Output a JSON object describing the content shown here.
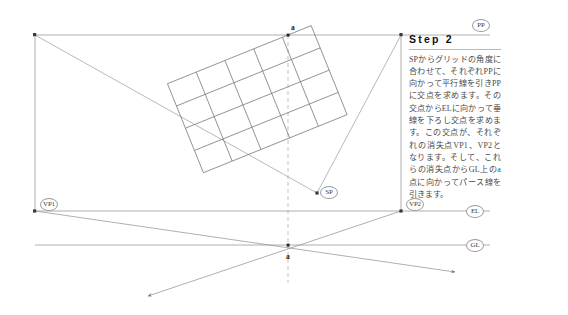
{
  "figure": {
    "title": "Step 2",
    "description_ja": "SPからグリッドの角度に合わせて、それぞれPPに向かって平行線を引きPPに交点を求めます。その交点からELに向かって垂線を下ろし交点を求めます。この交点が、それぞれの消失点VP1、VP2となります。そして、これらの消失点からGL上のa点に向かってパース線を引きます。"
  },
  "labels": {
    "pp": "PP",
    "el": "EL",
    "gl": "GL",
    "vp1": "VP1",
    "vp2": "VP2",
    "sp": "SP",
    "point_a_top": "a",
    "point_a_bottom": "a"
  },
  "geometry": {
    "lines": {
      "pp_y": 35,
      "el_y": 211,
      "gl_y": 245,
      "left_x": 35,
      "right_x": 490
    },
    "points": {
      "vp1": [
        35,
        211
      ],
      "vp2": [
        401,
        211
      ],
      "sp": [
        317,
        193
      ],
      "a_top": [
        288,
        35
      ],
      "a_bottom": [
        288,
        262
      ]
    },
    "grid": {
      "cols": 5,
      "rows": 4,
      "rotation_deg": -22,
      "origin": [
        288,
        35
      ]
    }
  },
  "colors": {
    "line": "#8d8d8d",
    "line_dark": "#6e6e6e",
    "text": "#4a4a4a",
    "heading": "#111111",
    "background": "#ffffff"
  }
}
